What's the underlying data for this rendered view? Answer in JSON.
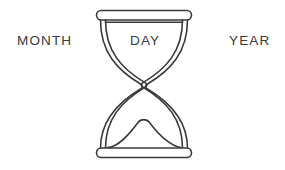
{
  "canvas": {
    "width": 285,
    "height": 170,
    "background_color": "#ffffff"
  },
  "illustration": {
    "name": "hourglass",
    "subject": "line-art hourglass with sand",
    "stroke_color": "#3a3a3c",
    "fill_color": "#ffffff",
    "stroke_width": 1.6
  },
  "labels": {
    "left": "MONTH",
    "center": "DAY",
    "right": "YEAR",
    "text_color": "#3a3a3c"
  },
  "icons": {
    "hourglass": "hourglass-icon",
    "top_cap": "hourglass-top-cap",
    "bottom_cap": "hourglass-bottom-cap",
    "upper_chamber": "hourglass-upper-chamber",
    "lower_chamber": "hourglass-lower-chamber",
    "neck": "hourglass-neck",
    "sand_level_line": "sand-level-line",
    "sand_mound": "sand-mound"
  }
}
